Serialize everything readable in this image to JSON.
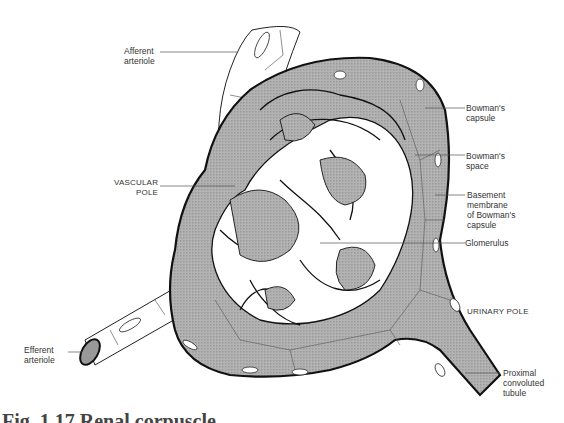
{
  "figure": {
    "caption": "Fig. 1.17 Renal corpuscle",
    "colors": {
      "outline": "#111111",
      "shading": "#a9a9a9",
      "background": "#ffffff",
      "leader_line": "#555555"
    }
  },
  "labels": {
    "afferent_arteriole": "Afferent\narteriole",
    "vascular_pole": "VASCULAR\nPOLE",
    "efferent_arteriole": "Efferent\narteriole",
    "bowmans_capsule": "Bowman's\ncapsule",
    "bowmans_space": "Bowman's\nspace",
    "basement_membrane": "Basement\nmembrane\nof Bowman's\ncapsule",
    "glomerulus": "Glomerulus",
    "urinary_pole": "URINARY POLE",
    "proximal_convoluted_tubule": "Proximal\nconvoluted\ntubule"
  }
}
